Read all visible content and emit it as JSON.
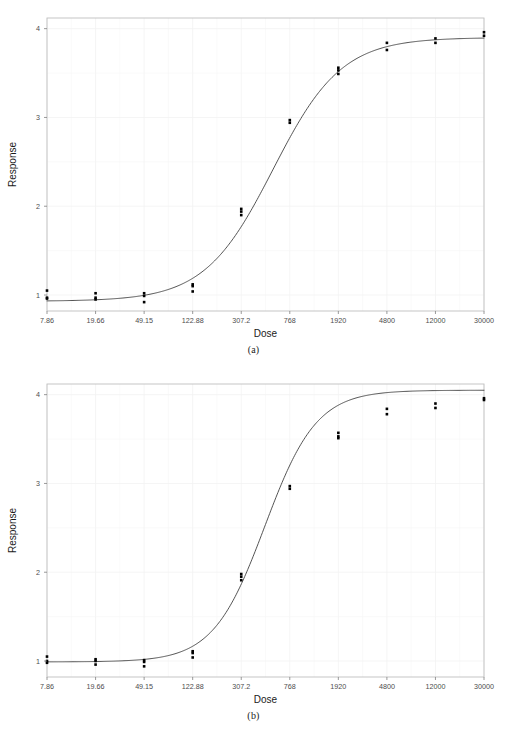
{
  "figure": {
    "panels": [
      {
        "id": "a",
        "caption": "(a)"
      },
      {
        "id": "b",
        "caption": "(b)"
      }
    ]
  },
  "chart_data": [
    {
      "type": "scatter",
      "panel": "a",
      "title": "",
      "subtitle": "",
      "xlabel": "Dose",
      "ylabel": "Response",
      "legend": null,
      "grid": true,
      "grid_color": "#f2f2f2",
      "panel_border_color": "#bfbfbf",
      "point_color": "#000000",
      "line_color": "#404040",
      "x_scale": "log-ordinal",
      "x_tick_labels": [
        "7.86",
        "19.66",
        "49.15",
        "122.88",
        "307.2",
        "768",
        "1920",
        "4800",
        "12000",
        "30000"
      ],
      "x_tick_values": [
        7.86,
        19.66,
        49.15,
        122.88,
        307.2,
        768,
        1920,
        4800,
        12000,
        30000
      ],
      "y_tick_labels": [
        "1",
        "2",
        "3",
        "4"
      ],
      "y_tick_values": [
        1,
        2,
        3,
        4
      ],
      "ylim": [
        0.82,
        4.12
      ],
      "points": [
        {
          "x": 7.86,
          "y": 1.05
        },
        {
          "x": 7.86,
          "y": 0.97
        },
        {
          "x": 7.86,
          "y": 0.96
        },
        {
          "x": 19.66,
          "y": 1.02
        },
        {
          "x": 19.66,
          "y": 0.97
        },
        {
          "x": 19.66,
          "y": 0.95
        },
        {
          "x": 49.15,
          "y": 1.02
        },
        {
          "x": 49.15,
          "y": 0.99
        },
        {
          "x": 49.15,
          "y": 0.92
        },
        {
          "x": 122.88,
          "y": 1.12
        },
        {
          "x": 122.88,
          "y": 1.1
        },
        {
          "x": 122.88,
          "y": 1.04
        },
        {
          "x": 307.2,
          "y": 1.97
        },
        {
          "x": 307.2,
          "y": 1.94
        },
        {
          "x": 307.2,
          "y": 1.9
        },
        {
          "x": 768,
          "y": 2.97
        },
        {
          "x": 768,
          "y": 2.94
        },
        {
          "x": 1920,
          "y": 3.56
        },
        {
          "x": 1920,
          "y": 3.53
        },
        {
          "x": 1920,
          "y": 3.49
        },
        {
          "x": 4800,
          "y": 3.84
        },
        {
          "x": 4800,
          "y": 3.76
        },
        {
          "x": 12000,
          "y": 3.89
        },
        {
          "x": 12000,
          "y": 3.84
        },
        {
          "x": 30000,
          "y": 3.96
        },
        {
          "x": 30000,
          "y": 3.92
        }
      ],
      "fit_curve": {
        "model": "4-parameter logistic",
        "bottom": 0.93,
        "top": 3.9,
        "ec50": 560,
        "hill": 1.55
      }
    },
    {
      "type": "scatter",
      "panel": "b",
      "title": "",
      "subtitle": "",
      "xlabel": "Dose",
      "ylabel": "Response",
      "legend": null,
      "grid": true,
      "grid_color": "#f2f2f2",
      "panel_border_color": "#bfbfbf",
      "point_color": "#000000",
      "line_color": "#404040",
      "x_scale": "log-ordinal",
      "x_tick_labels": [
        "7.86",
        "19.66",
        "49.15",
        "122.88",
        "307.2",
        "768",
        "1920",
        "4800",
        "12000",
        "30000"
      ],
      "x_tick_values": [
        7.86,
        19.66,
        49.15,
        122.88,
        307.2,
        768,
        1920,
        4800,
        12000,
        30000
      ],
      "y_tick_labels": [
        "1",
        "2",
        "3",
        "4"
      ],
      "y_tick_values": [
        1,
        2,
        3,
        4
      ],
      "ylim": [
        0.82,
        4.12
      ],
      "points": [
        {
          "x": 7.86,
          "y": 1.05
        },
        {
          "x": 7.86,
          "y": 1.0
        },
        {
          "x": 7.86,
          "y": 0.98
        },
        {
          "x": 19.66,
          "y": 1.02
        },
        {
          "x": 19.66,
          "y": 1.0
        },
        {
          "x": 19.66,
          "y": 0.96
        },
        {
          "x": 49.15,
          "y": 1.01
        },
        {
          "x": 49.15,
          "y": 0.99
        },
        {
          "x": 49.15,
          "y": 0.94
        },
        {
          "x": 122.88,
          "y": 1.11
        },
        {
          "x": 122.88,
          "y": 1.09
        },
        {
          "x": 122.88,
          "y": 1.04
        },
        {
          "x": 307.2,
          "y": 1.98
        },
        {
          "x": 307.2,
          "y": 1.95
        },
        {
          "x": 307.2,
          "y": 1.91
        },
        {
          "x": 768,
          "y": 2.97
        },
        {
          "x": 768,
          "y": 2.94
        },
        {
          "x": 1920,
          "y": 3.57
        },
        {
          "x": 1920,
          "y": 3.53
        },
        {
          "x": 1920,
          "y": 3.51
        },
        {
          "x": 4800,
          "y": 3.84
        },
        {
          "x": 4800,
          "y": 3.78
        },
        {
          "x": 12000,
          "y": 3.9
        },
        {
          "x": 12000,
          "y": 3.85
        },
        {
          "x": 30000,
          "y": 3.96
        },
        {
          "x": 30000,
          "y": 3.94
        }
      ],
      "fit_curve": {
        "model": "4-parameter logistic",
        "bottom": 0.99,
        "top": 4.05,
        "ec50": 480,
        "hill": 2.05
      }
    }
  ]
}
